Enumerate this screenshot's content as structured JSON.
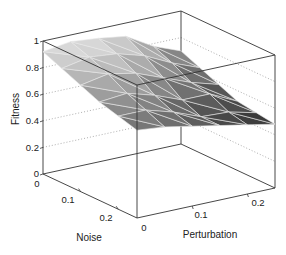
{
  "chart_data": {
    "type": "surface",
    "title": "",
    "xlabel": "Noise",
    "ylabel": "Perturbation",
    "zlabel": "Fitness",
    "x_ticks": [
      "0",
      "0.1",
      "0.2"
    ],
    "y_ticks": [
      "0",
      "0.1",
      "0.2"
    ],
    "z_ticks": [
      "0",
      "0.2",
      "0.4",
      "0.6",
      "0.8",
      "1"
    ],
    "xlim": [
      0,
      0.25
    ],
    "ylim": [
      0,
      0.25
    ],
    "zlim": [
      0,
      1
    ],
    "grid": true,
    "colormap": "gray",
    "noise": [
      0,
      0.05,
      0.1,
      0.15,
      0.2,
      0.25
    ],
    "perturbation": [
      0,
      0.05,
      0.1,
      0.15,
      0.2,
      0.25
    ],
    "fitness": [
      [
        0.92,
        0.95,
        0.93,
        0.9,
        0.78,
        0.7
      ],
      [
        0.86,
        0.9,
        0.88,
        0.82,
        0.72,
        0.64
      ],
      [
        0.8,
        0.84,
        0.8,
        0.72,
        0.64,
        0.58
      ],
      [
        0.74,
        0.76,
        0.7,
        0.62,
        0.62,
        0.52
      ],
      [
        0.7,
        0.7,
        0.64,
        0.56,
        0.55,
        0.5
      ],
      [
        0.66,
        0.64,
        0.6,
        0.56,
        0.52,
        0.48
      ]
    ]
  },
  "axes": {
    "z_label": "Fitness",
    "x_label": "Noise",
    "y_label": "Perturbation",
    "z_tick_labels": [
      "0",
      "0.2",
      "0.4",
      "0.6",
      "0.8",
      "1"
    ],
    "x_tick_labels": [
      "0",
      "0.1",
      "0.2"
    ],
    "y_tick_labels": [
      "0",
      "0.1",
      "0.2"
    ]
  }
}
